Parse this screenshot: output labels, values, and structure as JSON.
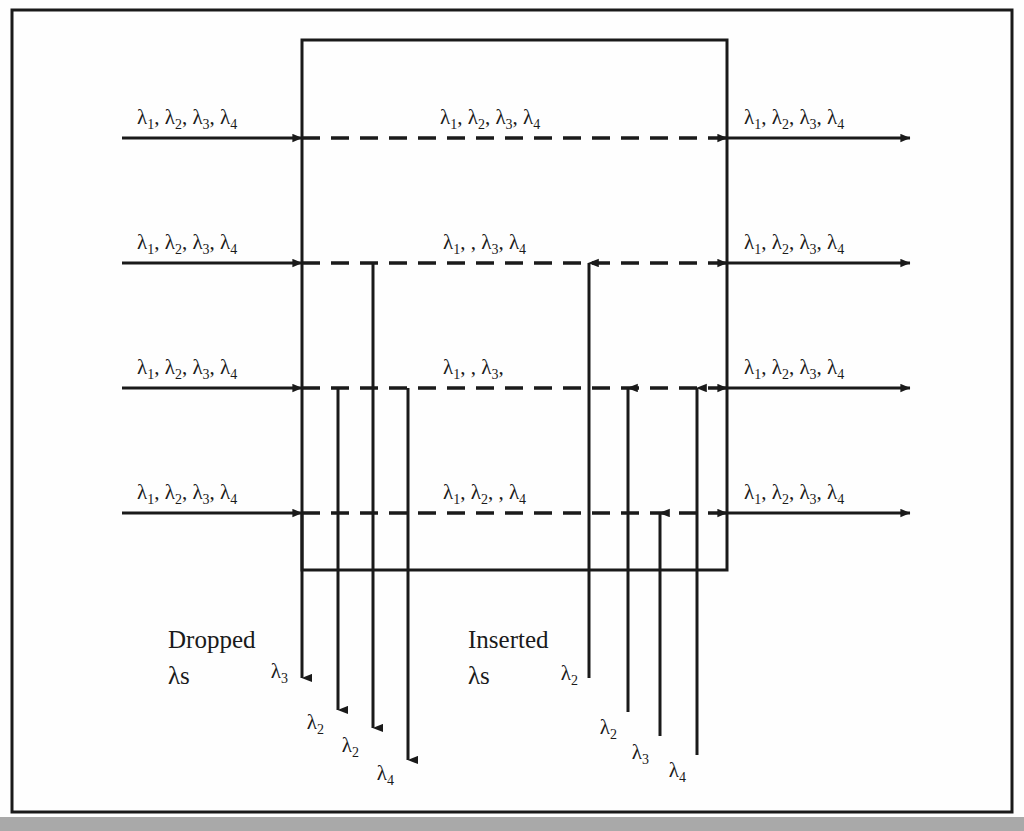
{
  "figure": {
    "type": "diagram",
    "background_color": "#fefefe",
    "line_color": "#1a1a1a",
    "frame": {
      "x": 12,
      "y": 10,
      "width": 1000,
      "height": 802
    },
    "node_box": {
      "x": 302,
      "y": 40,
      "width": 425,
      "height": 530
    },
    "bottom_strip_color": "#a9a9a9"
  },
  "labels": {
    "lambda": "λ",
    "dropped_title_line1": "Dropped",
    "dropped_title_line2": "λs",
    "inserted_title_line1": "Inserted",
    "inserted_title_line2": "λs"
  },
  "fibers": [
    {
      "id": "fiber-1",
      "y": 138,
      "input_label": {
        "text": "λ1, λ2, λ3, λ4",
        "parts": [
          "1",
          "2",
          "3",
          "4"
        ]
      },
      "middle_label": {
        "text": "λ1, λ2, λ3, λ4",
        "parts": [
          "1",
          "2",
          "3",
          "4"
        ]
      },
      "output_label": {
        "text": "λ1, λ2, λ3, λ4",
        "parts": [
          "1",
          "2",
          "3",
          "4"
        ]
      }
    },
    {
      "id": "fiber-2",
      "y": 263,
      "input_label": {
        "text": "λ1, λ2, λ3, λ4",
        "parts": [
          "1",
          "2",
          "3",
          "4"
        ]
      },
      "middle_label": {
        "text": "λ1, , λ3, λ4",
        "parts": [
          "1",
          "",
          "3",
          "4"
        ]
      },
      "output_label": {
        "text": "λ1, λ2, λ3, λ4",
        "parts": [
          "1",
          "2",
          "3",
          "4"
        ]
      }
    },
    {
      "id": "fiber-3",
      "y": 388,
      "input_label": {
        "text": "λ1, λ2, λ3, λ4",
        "parts": [
          "1",
          "2",
          "3",
          "4"
        ]
      },
      "middle_label": {
        "text": "λ1, , λ3,",
        "parts": [
          "1",
          "",
          "3",
          ""
        ]
      },
      "output_label": {
        "text": "λ1, λ2, λ3, λ4",
        "parts": [
          "1",
          "2",
          "3",
          "4"
        ]
      }
    },
    {
      "id": "fiber-4",
      "y": 513,
      "input_label": {
        "text": "λ1, λ2, λ3, λ4",
        "parts": [
          "1",
          "2",
          "3",
          "4"
        ]
      },
      "middle_label": {
        "text": "λ1, λ2, , λ4",
        "parts": [
          "1",
          "2",
          "",
          "4"
        ]
      },
      "output_label": {
        "text": "λ1, λ2, λ3, λ4",
        "parts": [
          "1",
          "2",
          "3",
          "4"
        ]
      }
    }
  ],
  "dropped": [
    {
      "id": "drop-1",
      "x": 302,
      "from_y": 513,
      "to_y": 678,
      "label_sub": "3",
      "label_x": 288,
      "label_y": 672
    },
    {
      "id": "drop-2",
      "x": 338,
      "from_y": 388,
      "to_y": 710,
      "label_sub": "2",
      "label_x": 346,
      "label_y": 725
    },
    {
      "id": "drop-3",
      "x": 373,
      "from_y": 263,
      "to_y": 728,
      "label_sub": "2",
      "label_x": 393,
      "label_y": 748
    },
    {
      "id": "drop-4",
      "x": 408,
      "from_y": 388,
      "to_y": 760,
      "label_sub": "4",
      "label_x": 430,
      "label_y": 776
    }
  ],
  "inserted": [
    {
      "id": "insert-1",
      "x": 589,
      "to_y": 263,
      "from_y": 678,
      "label_sub": "2",
      "label_x": 554,
      "label_y": 672
    },
    {
      "id": "insert-2",
      "x": 628,
      "to_y": 388,
      "from_y": 712,
      "label_sub": "2",
      "label_x": 601,
      "label_y": 730
    },
    {
      "id": "insert-3",
      "x": 660,
      "to_y": 513,
      "from_y": 736,
      "label_sub": "3",
      "label_x": 640,
      "label_y": 755
    },
    {
      "id": "insert-4",
      "x": 697,
      "to_y": 388,
      "from_y": 755,
      "label_sub": "4",
      "label_x": 678,
      "label_y": 773
    }
  ],
  "captions": [
    {
      "id": "dropped-caption",
      "x": 168,
      "y": 648,
      "line1": "Dropped",
      "line2": "λs"
    },
    {
      "id": "inserted-caption",
      "x": 468,
      "y": 648,
      "line1": "Inserted",
      "line2": "λs"
    }
  ],
  "geometry": {
    "input_start_x": 122,
    "input_end_x": 302,
    "output_start_x": 727,
    "output_end_x": 910,
    "dash_pattern": "18 11"
  }
}
